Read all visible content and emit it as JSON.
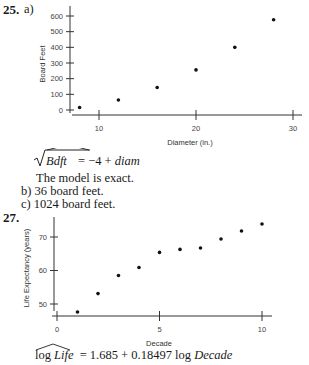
{
  "problem25": {
    "number": "25.",
    "part_a_label": "a)",
    "equation": {
      "lhs": "Bdft",
      "rhs_prefix": "= −4 + ",
      "rhs_var": "diam"
    },
    "note": "The model is exact.",
    "part_b": "b) 36 board feet.",
    "part_c": "c) 1024 board feet."
  },
  "problem27": {
    "number": "27.",
    "equation": {
      "lhs_fn": "log",
      "lhs_var": "Life",
      "rhs_prefix": "= 1.685 + 0.18497 log ",
      "rhs_var": "Decade"
    }
  },
  "chart_data": [
    {
      "type": "scatter",
      "title": "",
      "xlabel": "Diameter (in.)",
      "ylabel": "Board Feet",
      "xlim": [
        7,
        31
      ],
      "ylim": [
        -20,
        650
      ],
      "xticks": [
        10,
        20,
        30
      ],
      "yticks": [
        0,
        100,
        200,
        300,
        400,
        500,
        600
      ],
      "grid": false,
      "x": [
        8,
        12,
        16,
        20,
        24,
        28
      ],
      "y": [
        16,
        64,
        144,
        256,
        400,
        576
      ]
    },
    {
      "type": "scatter",
      "title": "",
      "xlabel": "Decade",
      "ylabel": "Life Expectancy (years)",
      "xlim": [
        -0.5,
        10.8
      ],
      "ylim": [
        46.5,
        76
      ],
      "xticks": [
        0,
        5,
        10
      ],
      "yticks": [
        50,
        60,
        70
      ],
      "grid": false,
      "x": [
        1,
        2,
        3,
        4,
        5,
        6,
        7,
        8,
        9,
        10
      ],
      "y": [
        47.6,
        53.1,
        58.5,
        60.9,
        65.4,
        66.3,
        66.7,
        69.4,
        71.8,
        73.9
      ]
    }
  ]
}
